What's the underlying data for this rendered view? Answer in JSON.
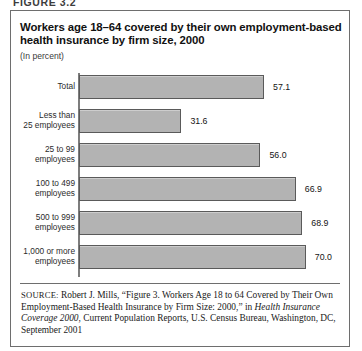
{
  "figure": {
    "number_label": "FIGURE 3.2"
  },
  "title": {
    "main": "Workers age 18–64 covered by their own employment-based health insurance by firm size, 2000",
    "subtitle": "(In percent)"
  },
  "source": {
    "kicker": "SOURCE:",
    "text_before_italic": " Robert J. Mills, “Figure 3. Workers Age 18 to 64 Covered by Their Own Employment-Based Health Insurance by Firm Size: 2000,” in ",
    "italic_title": "Health Insurance Coverage 2000",
    "text_after_italic": ", Current Population Reports, U.S. Census Bureau, Washington, DC, September 2001"
  },
  "chart_data": {
    "type": "bar",
    "orientation": "horizontal",
    "title": "Workers age 18–64 covered by their own employment-based health insurance by firm size, 2000",
    "subtitle": "(In percent)",
    "xlabel": "",
    "ylabel": "",
    "xlim": [
      0,
      75
    ],
    "grid": false,
    "legend": false,
    "value_format": "one-decimal",
    "categories": [
      "Total",
      "Less than\n25 employees",
      "25 to 99\nemployees",
      "100 to 499\nemployees",
      "500 to 999\nemployees",
      "1,000 or more\nemployees"
    ],
    "values": [
      57.1,
      31.6,
      56.0,
      66.9,
      68.9,
      70.0
    ],
    "value_labels": [
      "57.1",
      "31.6",
      "56.0",
      "66.9",
      "68.9",
      "70.0"
    ],
    "bar_fill_color": "#b3b3b3",
    "bar_border_color": "#5a5a5a",
    "axis_color": "#7d7d7d"
  }
}
